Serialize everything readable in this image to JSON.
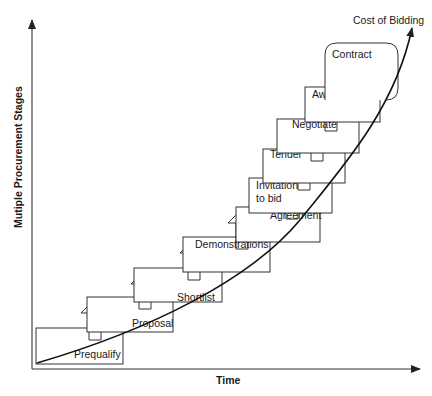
{
  "diagram": {
    "axes": {
      "y_label": "Mutiple Procurement Stages",
      "x_label": "Time"
    },
    "curve_label": "Cost of Bidding",
    "stages": [
      {
        "label": "Prequalify",
        "box": [
          36,
          328,
          123,
          364
        ],
        "text_xy": [
          74,
          358
        ]
      },
      {
        "label": "Proposal",
        "box": [
          87,
          297,
          173,
          332
        ],
        "text_xy": [
          132,
          327
        ]
      },
      {
        "label": "Shortlist",
        "box": [
          134,
          268,
          222,
          302
        ],
        "text_xy": [
          177,
          301
        ]
      },
      {
        "label": "Demonstrations",
        "box": [
          183,
          237,
          270,
          272
        ],
        "text_xy": [
          195,
          248
        ]
      },
      {
        "label": "Agreement",
        "box": [
          236,
          207,
          320,
          242
        ],
        "text_xy": [
          270,
          219
        ]
      },
      {
        "label": "Invitation",
        "label2": "to bid",
        "box": [
          249,
          178,
          332,
          213
        ],
        "text_xy": [
          256,
          189
        ]
      },
      {
        "label": "Tender",
        "box": [
          263,
          149,
          345,
          183
        ],
        "text_xy": [
          270,
          158
        ]
      },
      {
        "label": "Negotiate",
        "box": [
          277,
          119,
          359,
          153
        ],
        "text_xy": [
          292,
          128
        ]
      },
      {
        "label": "Award",
        "box": [
          305,
          87,
          380,
          122
        ],
        "text_xy": [
          312,
          98
        ]
      },
      {
        "label": "Contract",
        "box": [
          325,
          43,
          398,
          100
        ],
        "text_xy": [
          332,
          58
        ]
      }
    ]
  }
}
